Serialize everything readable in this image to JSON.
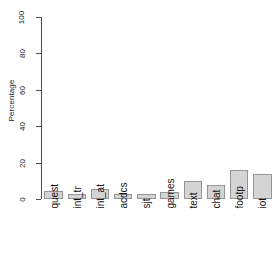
{
  "chart_data": {
    "type": "bar",
    "title": "",
    "subtitle": "",
    "xlabel": "",
    "ylabel": "Percentage",
    "categories": [
      "quest",
      "int_tr",
      "int_at",
      "acdcs",
      "sjt",
      "games",
      "text",
      "chat",
      "footp",
      "iot"
    ],
    "values": [
      4.5,
      3,
      5.5,
      3,
      2.5,
      4,
      10,
      7.5,
      16,
      14
    ],
    "ylim": [
      0,
      100
    ],
    "yticks": [
      0,
      20,
      40,
      60,
      80,
      100
    ],
    "ytick_labels": [
      "0",
      "20",
      "40",
      "60",
      "80",
      "100"
    ],
    "grid": false,
    "legend": null,
    "legend_position": "none",
    "bar_fill_color": "#d4d4d4",
    "bar_border_color": "#959595",
    "axis_color": "#4d4d4d",
    "background_color": "#ffffff",
    "text_color": "#111111",
    "xtick_label_rotation": 90
  }
}
